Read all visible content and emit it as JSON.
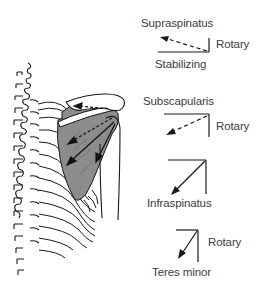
{
  "figure": {
    "anatomy": {
      "description": "Posterior view of spine, ribs, scapula and humerus with shaded rotator cuff muscles",
      "muscle_fill": "#8c8c8c",
      "line_color": "#1a1a1a"
    },
    "vectors": [
      {
        "muscle": "Supraspinatus",
        "components": [
          "Rotary",
          "Stabilizing"
        ],
        "rotary_label": "Rotary",
        "stabilizing_label": "Stabilizing",
        "resultant_style": "dashed",
        "resultant_direction": "up-left"
      },
      {
        "muscle": "Subscapularis",
        "components": [
          "Rotary"
        ],
        "rotary_label": "Rotary",
        "resultant_style": "dashed",
        "resultant_direction": "down-left"
      },
      {
        "muscle": "Infraspinatus",
        "components": [],
        "resultant_style": "solid",
        "resultant_direction": "down-left"
      },
      {
        "muscle": "Teres minor",
        "components": [
          "Rotary"
        ],
        "rotary_label": "Rotary",
        "resultant_style": "solid",
        "resultant_direction": "down-left"
      }
    ]
  }
}
